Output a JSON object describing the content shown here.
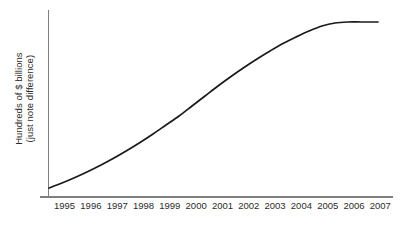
{
  "chart_data": {
    "type": "line",
    "title": "",
    "xlabel": "",
    "ylabel_lines": [
      "Hundreds of $ billions",
      "(just note difference)"
    ],
    "categories": [
      "1995",
      "1996",
      "1997",
      "1998",
      "1999",
      "2000",
      "2001",
      "2002",
      "2003",
      "2004",
      "2005",
      "2006",
      "2007"
    ],
    "values": [
      55,
      95,
      140,
      190,
      245,
      310,
      385,
      470,
      570,
      685,
      815,
      960,
      1120
    ],
    "ylim": [
      0,
      1200
    ],
    "y_tick_labels": [],
    "grid": false,
    "legend": null,
    "annotations": [],
    "series": [
      {
        "name": "growth",
        "color": "#1a1a1a",
        "values": [
          55,
          95,
          140,
          190,
          245,
          310,
          385,
          470,
          570,
          685,
          815,
          960,
          1120
        ]
      }
    ],
    "path_points": [
      [
        49,
        188
      ],
      [
        62,
        183
      ],
      [
        75,
        177.5
      ],
      [
        88,
        171.5
      ],
      [
        101,
        165
      ],
      [
        114,
        158
      ],
      [
        127,
        150.5
      ],
      [
        140,
        142.5
      ],
      [
        153,
        134
      ],
      [
        166,
        125
      ],
      [
        179,
        116
      ],
      [
        192,
        106
      ],
      [
        205,
        96
      ],
      [
        218,
        86
      ],
      [
        231,
        76.5
      ],
      [
        244,
        67.5
      ],
      [
        257,
        59
      ],
      [
        270,
        51
      ],
      [
        283,
        43.5
      ],
      [
        296,
        37
      ],
      [
        309,
        31
      ],
      [
        322,
        26
      ],
      [
        335,
        23
      ],
      [
        348,
        22
      ],
      [
        361,
        22
      ],
      [
        378,
        22
      ]
    ]
  },
  "axes": {
    "y_axis_color": "#7f7f7f",
    "x_axis_color": "#7f7f7f",
    "curve_color": "#1a1a1a",
    "background": "#ffffff"
  }
}
